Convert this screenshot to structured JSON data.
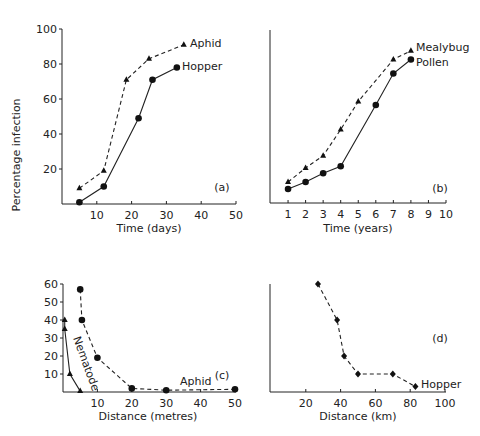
{
  "figure": {
    "ylabel_shared_top": "Percentage infection"
  },
  "chart_data": [
    {
      "panel": "(a)",
      "type": "line",
      "xlabel": "Time (days)",
      "ylabel": "Percentage infection",
      "xlim": [
        0,
        50
      ],
      "ylim": [
        0,
        100
      ],
      "xticks": [
        10,
        20,
        30,
        40,
        50
      ],
      "yticks": [
        20,
        40,
        60,
        80,
        100
      ],
      "grid": false,
      "series": [
        {
          "name": "Aphid",
          "marker": "triangle",
          "line": "dashed",
          "x": [
            5,
            12,
            18.5,
            25,
            35
          ],
          "y": [
            9,
            19,
            71,
            83,
            91
          ]
        },
        {
          "name": "Hopper",
          "marker": "circle",
          "line": "solid",
          "x": [
            5,
            12,
            22,
            26,
            33
          ],
          "y": [
            1,
            10,
            49,
            71,
            78
          ]
        }
      ]
    },
    {
      "panel": "(b)",
      "type": "line",
      "xlabel": "Time (years)",
      "ylabel": "",
      "xlim": [
        0,
        10
      ],
      "ylim": [
        0,
        100
      ],
      "xticks": [
        1,
        2,
        3,
        4,
        5,
        6,
        7,
        8,
        9,
        10
      ],
      "grid": false,
      "series": [
        {
          "name": "Mealybug",
          "marker": "triangle",
          "line": "dashed",
          "x": [
            1,
            2,
            3,
            4,
            5,
            7,
            8
          ],
          "y": [
            12,
            20,
            27,
            42,
            58,
            82,
            87
          ]
        },
        {
          "name": "Pollen",
          "marker": "circle",
          "line": "solid",
          "x": [
            1,
            2,
            3,
            4,
            6,
            7,
            8
          ],
          "y": [
            8,
            12,
            17,
            21,
            56,
            74,
            82
          ]
        }
      ]
    },
    {
      "panel": "(c)",
      "type": "line",
      "xlabel": "Distance (metres)",
      "ylabel": "Percentage infection",
      "xlim": [
        0,
        50
      ],
      "ylim": [
        0,
        60
      ],
      "xticks": [
        10,
        20,
        30,
        40,
        50
      ],
      "yticks": [
        10,
        20,
        30,
        40,
        50,
        60
      ],
      "grid": false,
      "series": [
        {
          "name": "Nematode",
          "marker": "triangle",
          "line": "solid",
          "x": [
            0.5,
            0.5,
            2,
            5
          ],
          "y": [
            40,
            35,
            10,
            0.5
          ]
        },
        {
          "name": "Aphid",
          "marker": "circle",
          "line": "dashed",
          "x": [
            5,
            5.5,
            10,
            20,
            30,
            50
          ],
          "y": [
            57,
            40,
            19,
            2,
            1,
            1.5
          ]
        }
      ]
    },
    {
      "panel": "(d)",
      "type": "line",
      "xlabel": "Distance (km)",
      "ylabel": "",
      "xlim": [
        0,
        100
      ],
      "ylim": [
        0,
        60
      ],
      "xticks": [
        20,
        40,
        60,
        80,
        100
      ],
      "grid": false,
      "series": [
        {
          "name": "Hopper",
          "marker": "diamond",
          "line": "dashed",
          "x": [
            27,
            38,
            42,
            50,
            70,
            83
          ],
          "y": [
            60,
            40,
            20,
            10,
            10,
            3
          ]
        }
      ]
    }
  ],
  "labels": {
    "a": {
      "tag": "(a)",
      "xlabel": "Time (days)",
      "s1": "Aphid",
      "s2": "Hopper",
      "xt": [
        "10",
        "20",
        "30",
        "40",
        "50"
      ],
      "yt": [
        "20",
        "40",
        "60",
        "80",
        "100"
      ]
    },
    "b": {
      "tag": "(b)",
      "xlabel": "Time (years)",
      "s1": "Mealybug",
      "s2": "Pollen",
      "xt": [
        "1",
        "2",
        "3",
        "4",
        "5",
        "6",
        "7",
        "8",
        "9",
        "10"
      ]
    },
    "c": {
      "tag": "(c)",
      "xlabel": "Distance (metres)",
      "s1": "Nematode",
      "s2": "Aphid",
      "xt": [
        "10",
        "20",
        "30",
        "40",
        "50"
      ],
      "yt": [
        "10",
        "20",
        "30",
        "40",
        "50",
        "60"
      ]
    },
    "d": {
      "tag": "(d)",
      "xlabel": "Distance (km)",
      "s1": "Hopper",
      "xt": [
        "20",
        "40",
        "60",
        "80",
        "100"
      ]
    }
  }
}
